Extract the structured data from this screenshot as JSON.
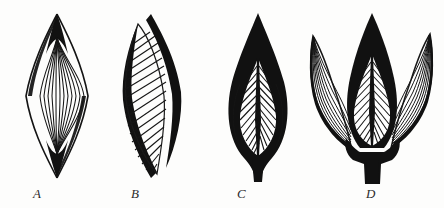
{
  "plate": {
    "title": "Comparative development of bud and leaf sheath, stages A-D",
    "background_color": "#fdfdfc",
    "ink_color": "#111111",
    "width": 444,
    "height": 208,
    "medium": "line engraving"
  },
  "figures": [
    {
      "label": "A",
      "label_x": 33,
      "label_y": 188,
      "caption": "Closed spindle-shaped bud with fine parallel longitudinal veins and solid dark tips",
      "center_x": 57,
      "top_y": 14,
      "bottom_y": 178,
      "half_width": 32,
      "vein_count": 12,
      "vein_style": "parallel-longitudinal",
      "outline": "spindle",
      "lobes": 1
    },
    {
      "label": "B",
      "label_x": 131,
      "label_y": 188,
      "caption": "Asymmetric bud with heavy black marginal sheath and oblique parallel hatching",
      "center_x": 152,
      "top_y": 14,
      "bottom_y": 178,
      "half_width": 32,
      "vein_count": 18,
      "vein_style": "oblique-hatch",
      "outline": "sigmoid-spindle",
      "lobes": 1
    },
    {
      "label": "C",
      "label_x": 237,
      "label_y": 188,
      "caption": "Bud enclosed by dark bract showing inner pinnate leaf with central midrib and chevron veins",
      "center_x": 258,
      "top_y": 13,
      "bottom_y": 182,
      "half_width": 36,
      "vein_count": 13,
      "vein_style": "pinnate-chevron",
      "outline": "flame",
      "lobes": 1
    },
    {
      "label": "D",
      "label_x": 366,
      "label_y": 188,
      "caption": "Expanded stage, three diverging lobes on a common dark stalk, outer lobes spread laterally",
      "center_x": 372,
      "top_y": 13,
      "bottom_y": 184,
      "half_width": 70,
      "vein_count": 13,
      "vein_style": "pinnate-chevron-plus-lateral-lobes",
      "outline": "trifid",
      "lobes": 3
    }
  ],
  "labels": {
    "a": "A",
    "b": "B",
    "c": "C",
    "d": "D"
  }
}
